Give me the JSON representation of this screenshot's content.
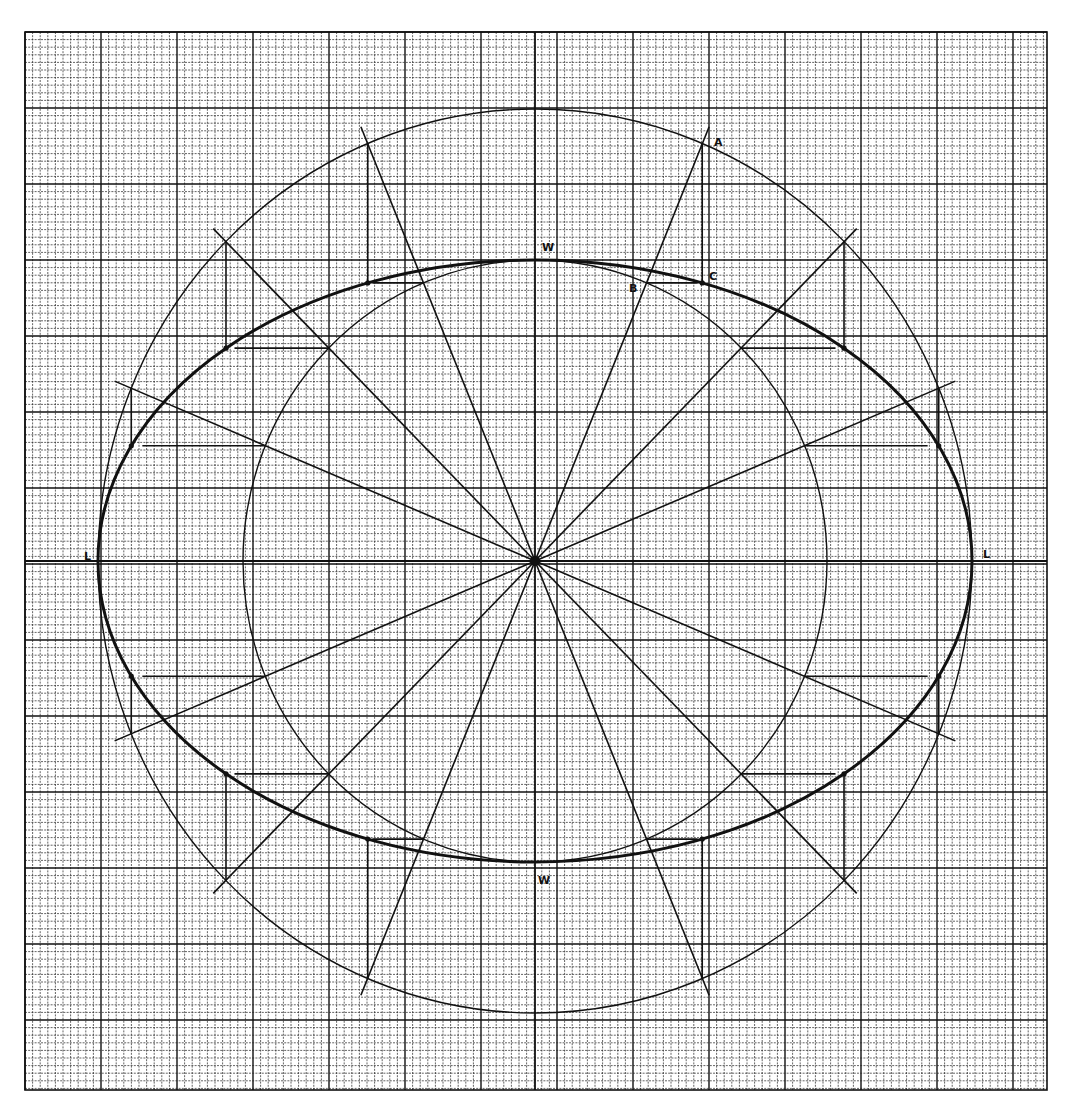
{
  "canvas": {
    "width": 1073,
    "height": 1109,
    "background": "#ffffff"
  },
  "grid": {
    "x0": 25,
    "y0": 32,
    "x1": 1047,
    "y1": 1090,
    "minor_step": 7.6,
    "major_every": 10,
    "major_origin_x": 24,
    "major_origin_y": 32,
    "minor_color": "#222222",
    "major_color": "#111111",
    "minor_width": 0.7,
    "major_width": 1.4,
    "minor_dash": "2,1.2"
  },
  "construction": {
    "center": {
      "x": 535,
      "y": 561
    },
    "outer_circle": {
      "rx": 437,
      "ry": 452,
      "stroke_width": 1.4
    },
    "inner_circle": {
      "rx": 292,
      "ry": 301,
      "stroke_width": 1.4
    },
    "ellipse": {
      "rx": 437,
      "ry": 301,
      "stroke_width": 3
    },
    "axes": {
      "stroke_width": 1.8
    },
    "radial_angles_deg": [
      22.5,
      45,
      67.5,
      112.5,
      135,
      157.5
    ],
    "radial_overhang": 18,
    "radial_stroke_width": 1.6,
    "projector_stroke_width": 1.6,
    "stroke_color": "#111111"
  },
  "labels": [
    {
      "id": "label-A",
      "text": "A",
      "x": 714,
      "y": 146
    },
    {
      "id": "label-B",
      "text": "B",
      "x": 629,
      "y": 292
    },
    {
      "id": "label-C",
      "text": "C",
      "x": 709,
      "y": 280
    },
    {
      "id": "label-W-top",
      "text": "W",
      "x": 542,
      "y": 251
    },
    {
      "id": "label-W-bottom",
      "text": "W",
      "x": 538,
      "y": 884
    },
    {
      "id": "label-L-left",
      "text": "L",
      "x": 84,
      "y": 560
    },
    {
      "id": "label-L-right",
      "text": "L",
      "x": 983,
      "y": 558
    }
  ]
}
